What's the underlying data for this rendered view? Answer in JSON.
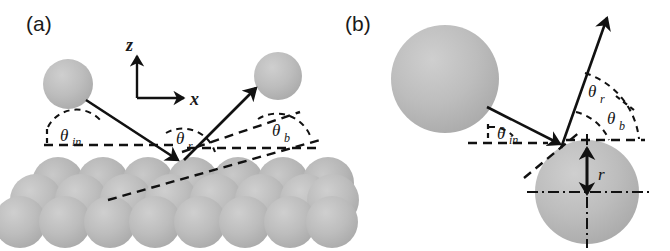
{
  "figure": {
    "width": 670,
    "height": 251,
    "background": "#ffffff",
    "ink_color": "#111111",
    "sphere_fill": "#b9b9b9",
    "sphere_fill_light": "#c6c6c6",
    "sphere_edge": "#a6a6a6"
  },
  "panels": [
    {
      "id": "a",
      "label": "(a)",
      "caption_position": "top-left",
      "axes": {
        "vertical_label": "z",
        "horizontal_label": "x"
      },
      "angles": [
        {
          "name": "theta-in",
          "symbol": "θ",
          "subscript": "in"
        },
        {
          "name": "theta-r",
          "symbol": "θ",
          "subscript": "r"
        },
        {
          "name": "theta-b",
          "symbol": "θ",
          "subscript": "b"
        }
      ],
      "description_elements": [
        "incoming-particle-sphere",
        "outgoing-particle-sphere",
        "incident-ray-arrow",
        "reflected-ray-arrow",
        "surface-dashed-line",
        "beam-direction-dashed-line",
        "substrate-sphere-lattice"
      ],
      "lattice": {
        "rows": 3,
        "spheres_per_row": [
          7,
          8,
          7
        ]
      }
    },
    {
      "id": "b",
      "label": "(b)",
      "caption_position": "top-left",
      "angles": [
        {
          "name": "theta-in",
          "symbol": "θ",
          "subscript": "in"
        },
        {
          "name": "theta-r",
          "symbol": "θ",
          "subscript": "r"
        },
        {
          "name": "theta-b",
          "symbol": "θ",
          "subscript": "b"
        }
      ],
      "radius": {
        "name": "radius",
        "symbol": "r"
      },
      "description_elements": [
        "incoming-particle-sphere",
        "target-sphere",
        "incident-ray-arrow",
        "reflected-ray-arrow",
        "horizontal-dashed-line",
        "tangent-dashed-line",
        "radius-arrow",
        "center-crosshair-dashdot"
      ]
    }
  ]
}
